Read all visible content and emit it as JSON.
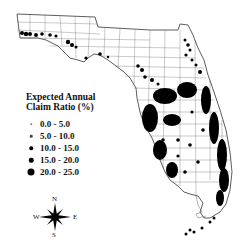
{
  "map": {
    "region": "Florida",
    "legend": {
      "title_line1": "Expected Annual",
      "title_line2": "Claim Ratio (%)",
      "classes": [
        {
          "label": "0.0 - 5.0",
          "dot_size": 1.5
        },
        {
          "label": "5.0 - 10.0",
          "dot_size": 2.5
        },
        {
          "label": "10.0 - 15.0",
          "dot_size": 3.5
        },
        {
          "label": "15.0 - 20.0",
          "dot_size": 4.5
        },
        {
          "label": "20.0 - 25.0",
          "dot_size": 7
        }
      ]
    },
    "compass": {
      "n": "N",
      "s": "S",
      "e": "E",
      "w": "W"
    },
    "colors": {
      "dots": "#000000",
      "boundaries": "#555555",
      "background": "#ffffff"
    }
  }
}
